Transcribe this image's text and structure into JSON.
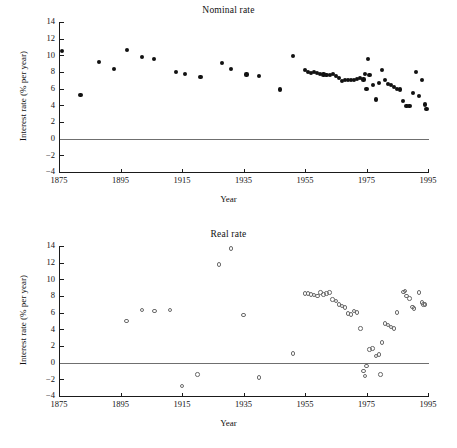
{
  "figure": {
    "xlabel": "Year",
    "ylabel": "Interest rate (% per year)"
  },
  "chart_data": [
    {
      "type": "scatter",
      "title": "Nominal rate",
      "xlabel": "Year",
      "ylabel": "Interest rate (% per year)",
      "xlim": [
        1875,
        1995
      ],
      "ylim": [
        -4,
        14
      ],
      "xticks": [
        1875,
        1895,
        1915,
        1935,
        1955,
        1975,
        1995
      ],
      "yticks": [
        -4,
        -2,
        0,
        2,
        4,
        6,
        8,
        10,
        12,
        14
      ],
      "grid": false,
      "legend": "none",
      "marker": "filled-circle",
      "zero_reference_line": 0,
      "points": [
        [
          1876,
          10.5
        ],
        [
          1882,
          5.2
        ],
        [
          1888,
          9.2
        ],
        [
          1893,
          8.4
        ],
        [
          1897,
          10.6
        ],
        [
          1902,
          9.8
        ],
        [
          1906,
          9.6
        ],
        [
          1913,
          8.0
        ],
        [
          1916,
          7.8
        ],
        [
          1921,
          7.4
        ],
        [
          1928,
          9.1
        ],
        [
          1931,
          8.4
        ],
        [
          1936,
          7.7
        ],
        [
          1940,
          7.5
        ],
        [
          1947,
          5.9
        ],
        [
          1951,
          9.9
        ],
        [
          1955,
          8.2
        ],
        [
          1956,
          8.0
        ],
        [
          1957,
          7.9
        ],
        [
          1958,
          8.0
        ],
        [
          1959,
          7.9
        ],
        [
          1960,
          7.8
        ],
        [
          1961,
          7.7
        ],
        [
          1962,
          7.6
        ],
        [
          1963,
          7.6
        ],
        [
          1964,
          7.8
        ],
        [
          1965,
          7.5
        ],
        [
          1966,
          7.3
        ],
        [
          1967,
          6.9
        ],
        [
          1968,
          7.0
        ],
        [
          1969,
          7.0
        ],
        [
          1970,
          7.0
        ],
        [
          1971,
          7.0
        ],
        [
          1972,
          7.2
        ],
        [
          1973,
          7.3
        ],
        [
          1974,
          7.1
        ],
        [
          1975,
          6.0
        ],
        [
          1974.5,
          7.8
        ],
        [
          1975.5,
          9.6
        ],
        [
          1976,
          7.6
        ],
        [
          1977,
          6.4
        ],
        [
          1978,
          4.7
        ],
        [
          1979,
          6.7
        ],
        [
          1980,
          8.2
        ],
        [
          1981,
          7.0
        ],
        [
          1982,
          6.6
        ],
        [
          1983,
          6.4
        ],
        [
          1984,
          6.2
        ],
        [
          1985,
          6.0
        ],
        [
          1986,
          5.9
        ],
        [
          1987,
          4.5
        ],
        [
          1988,
          3.9
        ],
        [
          1989,
          3.9
        ],
        [
          1990,
          5.5
        ],
        [
          1991,
          8.0
        ],
        [
          1992,
          5.1
        ],
        [
          1993,
          7.0
        ],
        [
          1994,
          4.1
        ],
        [
          1994.5,
          3.6
        ]
      ]
    },
    {
      "type": "scatter",
      "title": "Real rate",
      "xlabel": "Year",
      "ylabel": "Interest rate (% per year)",
      "xlim": [
        1875,
        1995
      ],
      "ylim": [
        -4,
        14
      ],
      "xticks": [
        1875,
        1895,
        1915,
        1935,
        1955,
        1975,
        1995
      ],
      "yticks": [
        -4,
        -2,
        0,
        2,
        4,
        6,
        8,
        10,
        12,
        14
      ],
      "grid": false,
      "legend": "none",
      "marker": "open-circle",
      "zero_reference_line": 0,
      "points": [
        [
          1897,
          5.0
        ],
        [
          1902,
          6.3
        ],
        [
          1906,
          6.2
        ],
        [
          1911,
          6.3
        ],
        [
          1915,
          -2.8
        ],
        [
          1920,
          -1.4
        ],
        [
          1927,
          11.8
        ],
        [
          1931,
          13.7
        ],
        [
          1935,
          5.7
        ],
        [
          1940,
          -1.8
        ],
        [
          1951,
          1.1
        ],
        [
          1955,
          8.3
        ],
        [
          1956,
          8.3
        ],
        [
          1957,
          8.2
        ],
        [
          1958,
          8.1
        ],
        [
          1959,
          8.0
        ],
        [
          1960,
          8.4
        ],
        [
          1961,
          8.2
        ],
        [
          1962,
          8.3
        ],
        [
          1963,
          8.4
        ],
        [
          1964,
          7.6
        ],
        [
          1965,
          7.4
        ],
        [
          1966,
          7.0
        ],
        [
          1967,
          6.8
        ],
        [
          1968,
          6.6
        ],
        [
          1969,
          5.9
        ],
        [
          1970,
          5.8
        ],
        [
          1971,
          6.2
        ],
        [
          1972,
          6.0
        ],
        [
          1973,
          4.1
        ],
        [
          1974,
          -1.0
        ],
        [
          1974.5,
          -1.6
        ],
        [
          1975,
          -0.4
        ],
        [
          1976,
          1.6
        ],
        [
          1977,
          1.7
        ],
        [
          1978,
          0.8
        ],
        [
          1979,
          1.0
        ],
        [
          1979.5,
          -1.4
        ],
        [
          1980,
          2.4
        ],
        [
          1981,
          4.7
        ],
        [
          1982,
          4.5
        ],
        [
          1983,
          4.3
        ],
        [
          1984,
          4.1
        ],
        [
          1985,
          6.0
        ],
        [
          1987,
          8.5
        ],
        [
          1987.5,
          8.6
        ],
        [
          1988,
          8.0
        ],
        [
          1989,
          7.7
        ],
        [
          1990,
          6.7
        ],
        [
          1990.5,
          6.5
        ],
        [
          1992,
          8.4
        ],
        [
          1993,
          7.2
        ],
        [
          1993.5,
          7.0
        ],
        [
          1994,
          7.0
        ]
      ]
    }
  ]
}
